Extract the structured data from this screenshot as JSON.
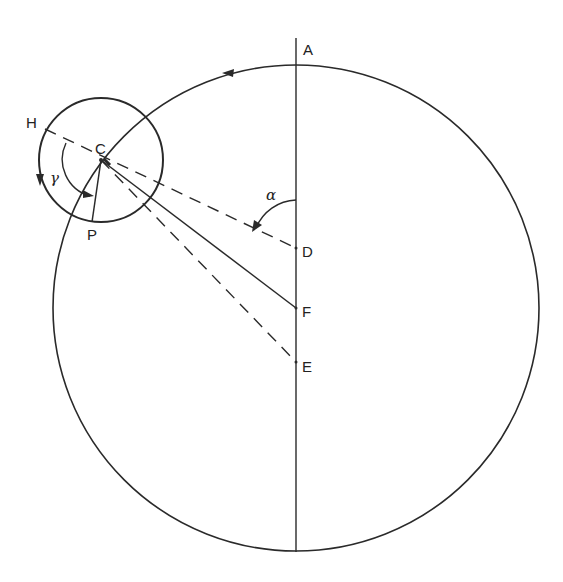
{
  "diagram": {
    "type": "geometric construction",
    "colors": {
      "stroke": "#2a2a2a",
      "background": "#ffffff"
    },
    "labels": {
      "A": "A",
      "C": "C",
      "D": "D",
      "E": "E",
      "F": "F",
      "H": "H",
      "P": "P",
      "alpha": "α",
      "gamma": "γ"
    },
    "elements": {
      "large_circle": {
        "center": [
          296,
          308
        ],
        "radius": 243,
        "arrow_direction": "counter-clockwise"
      },
      "small_circle": {
        "center_label": "C",
        "center": [
          101,
          160
        ],
        "radius": 62,
        "arrow_direction": "counter-clockwise"
      },
      "vertical_axis": {
        "from_label": "A",
        "to": "bottom of large circle",
        "points_on_axis": [
          "A",
          "D",
          "F",
          "E"
        ]
      },
      "lines": [
        {
          "from": "H",
          "to": "D",
          "style": "dashed",
          "through": "C"
        },
        {
          "from": "C",
          "to": "F",
          "style": "solid"
        },
        {
          "from": "C",
          "to": "E",
          "style": "dashed"
        },
        {
          "from": "C",
          "to": "P",
          "style": "solid"
        }
      ],
      "angles": [
        {
          "label": "α",
          "between": [
            "AD",
            "DC"
          ],
          "vertex": "D"
        },
        {
          "label": "γ",
          "between": [
            "CH",
            "CP"
          ],
          "vertex": "C"
        }
      ]
    }
  }
}
